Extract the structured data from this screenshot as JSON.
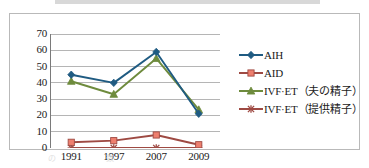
{
  "figure": {
    "frame_border_color": "#b9b9b9",
    "background": "#ffffff",
    "top_band_color": "#d8d8d8",
    "caption_fragment": "　　　　 の　 　 　 　 　 数 　 　 　 　 　 　 　 　 　 　 　 　 　 　 　"
  },
  "chart_data": {
    "type": "line",
    "title": "",
    "subtitle": "",
    "xlabel": "",
    "ylabel": "",
    "categories": [
      "1991",
      "1997",
      "2007",
      "2009"
    ],
    "ylim": [
      0,
      70
    ],
    "ytick_values": [
      0,
      10,
      20,
      30,
      40,
      50,
      60,
      70
    ],
    "ytick_labels": [
      "0",
      "10",
      "20",
      "30",
      "40",
      "50",
      "60",
      "70"
    ],
    "grid": "horizontal",
    "legend_position": "right",
    "series": [
      {
        "name": "AIH",
        "values": [
          45,
          40,
          59,
          21
        ],
        "color": "#1F5B82",
        "marker": "diamond",
        "marker_color": "#1F5B82"
      },
      {
        "name": "AID",
        "values": [
          3.5,
          4.5,
          8,
          2
        ],
        "color": "#9E4A43",
        "marker": "square",
        "marker_color": "#EE7F6E"
      },
      {
        "name": "IVF·ET（夫の精子）",
        "values": [
          41,
          33,
          55,
          23.5
        ],
        "color": "#6E8B3D",
        "marker": "triangle",
        "marker_color": "#6E8B3D"
      },
      {
        "name": "IVF·ET（提供精子）",
        "values": [
          0,
          0,
          0,
          0
        ],
        "color": "#9E4A43",
        "marker": "star",
        "marker_color": "#9E4A43"
      }
    ]
  },
  "legend": {
    "items": [
      {
        "label": "AIH"
      },
      {
        "label": "AID"
      },
      {
        "label": "IVF·ET（夫の精子）"
      },
      {
        "label": "IVF·ET（提供精子）"
      }
    ]
  }
}
